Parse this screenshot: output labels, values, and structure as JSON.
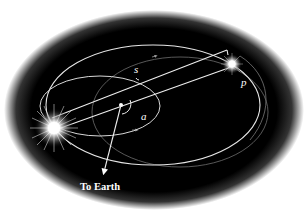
{
  "diagram": {
    "labels": {
      "separation": "s",
      "position_angle": "p",
      "inclination_angle": "a",
      "earth_direction": "To Earth"
    },
    "colors": {
      "background": "#000000",
      "page": "#ffffff",
      "orbit_line": "#e8e8e8",
      "faint_orbit": "#8a8a8a",
      "star_glow": "#ffffff"
    },
    "elements": {
      "primary_star": "large bright star at left",
      "secondary_star": "smaller star at upper right",
      "center_of_mass": "dot at orbit focus",
      "outer_orbit": "large ellipse",
      "inner_orbit": "small ellipse",
      "sky_plane": "faint ellipse"
    }
  }
}
